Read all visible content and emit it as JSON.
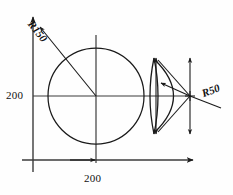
{
  "drawing": {
    "title": "Circle and arc construction dimension drawing",
    "background_color": "#fefefe",
    "line_color": "#1a1a1a",
    "axis_color": "#3b3b3b",
    "labels": {
      "dim_vertical": "200",
      "dim_horizontal": "200",
      "radius_large": "R150",
      "radius_small": "R50"
    },
    "icons": {
      "arrowhead": "arrowhead-icon",
      "leader_line": "leader-line-icon"
    },
    "geometry": {
      "origin_x": 33,
      "origin_y": 160,
      "vertical_axis_top_y": 14,
      "horizontal_axis_right_x": 197,
      "center_line_y": 96,
      "center_line_x": 96,
      "big_circle": {
        "cx": 96,
        "cy": 96,
        "r": 48,
        "label": "R150"
      },
      "arc_point": {
        "x": 190,
        "y": 96,
        "label": "R50"
      },
      "lens_left_x": 151,
      "lens_right_x": 157,
      "arc_vertical_left_x": 156,
      "arc_vertical_right_x": 190,
      "arc_top_y": 60,
      "arc_bottom_y": 132
    }
  }
}
